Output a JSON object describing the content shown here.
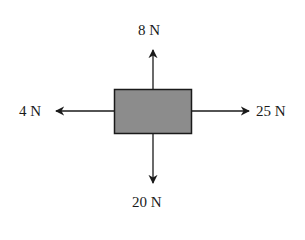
{
  "diagram": {
    "type": "free-body-diagram",
    "object": {
      "shape": "rectangle",
      "fill": "#8c8c8c",
      "stroke": "#1a1a1a"
    },
    "forces": [
      {
        "direction": "up",
        "label": "8 N",
        "magnitude": 8
      },
      {
        "direction": "left",
        "label": "4 N",
        "magnitude": 4
      },
      {
        "direction": "right",
        "label": "25 N",
        "magnitude": 25
      },
      {
        "direction": "down",
        "label": "20 N",
        "magnitude": 20
      }
    ]
  }
}
